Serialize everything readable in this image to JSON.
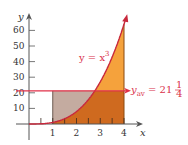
{
  "chart_data": {
    "type": "area",
    "title": "",
    "xlabel": "x",
    "ylabel": "y",
    "xlim": [
      0,
      4.4
    ],
    "ylim": [
      0,
      66
    ],
    "x_ticks": [
      1,
      2,
      3,
      4
    ],
    "y_ticks": [
      10,
      20,
      30,
      40,
      50,
      60
    ],
    "grid": false,
    "curve": {
      "name": "y = x^3",
      "label": "y = x",
      "label_exponent": "3",
      "x": [
        0,
        0.5,
        1,
        1.5,
        2,
        2.5,
        3,
        3.5,
        4
      ],
      "y": [
        0,
        0.125,
        1,
        3.375,
        8,
        15.625,
        27,
        42.875,
        64
      ]
    },
    "interval": [
      1,
      4
    ],
    "average_line": {
      "value": 21.25,
      "label_prefix": "y",
      "label_sub": "av",
      "label_eq": " = 21",
      "label_frac_num": "1",
      "label_frac_den": "4"
    },
    "colors": {
      "curve": "#c8283c",
      "average_line": "#e03048",
      "area_under_curve_below_avg": "#cf6a1f",
      "area_above_avg": "#f5a23c",
      "area_between_avg_and_curve": "#c4aba0",
      "axes": "#555555"
    }
  }
}
